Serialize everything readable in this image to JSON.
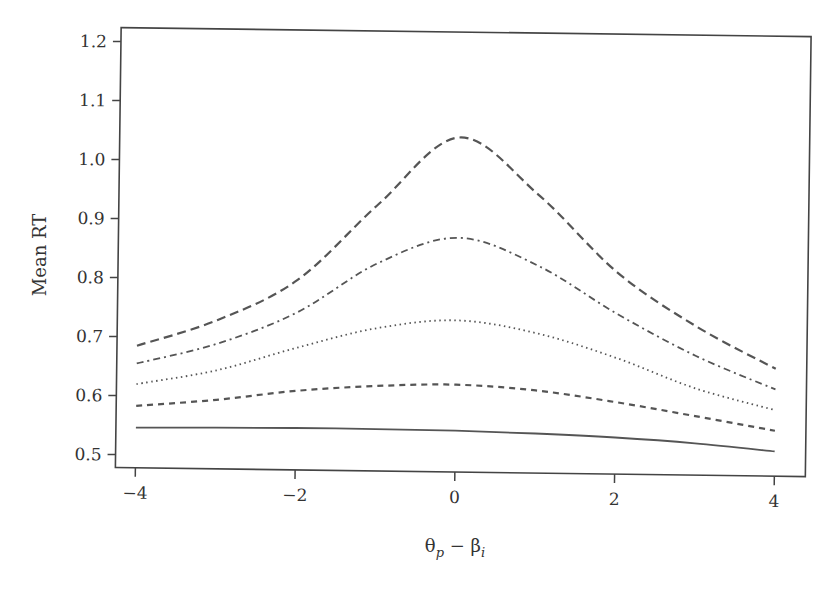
{
  "chart_data": {
    "type": "line",
    "title": "",
    "xlabel": "θp − βi",
    "xlabel_parts": {
      "theta": "θ",
      "theta_sub": "p",
      "minus": " − ",
      "beta": "β",
      "beta_sub": "i"
    },
    "ylabel": "Mean RT",
    "xlim": [
      -4,
      4
    ],
    "ylim": [
      0.5,
      1.2
    ],
    "x_ticks": [
      -4,
      -2,
      0,
      2,
      4
    ],
    "x_tick_labels": [
      "−4",
      "−2",
      "0",
      "2",
      "4"
    ],
    "y_ticks": [
      0.5,
      0.6,
      0.7,
      0.8,
      0.9,
      1.0,
      1.1,
      1.2
    ],
    "y_tick_labels": [
      "0.5",
      "0.6",
      "0.7",
      "0.8",
      "0.9",
      "1.0",
      "1.1",
      "1.2"
    ],
    "grid": false,
    "legend": null,
    "x": [
      -4,
      -3,
      -2,
      -1,
      0,
      1,
      2,
      3,
      4
    ],
    "series": [
      {
        "name": "long-dash",
        "style": "long-dash",
        "values": [
          0.685,
          0.73,
          0.8,
          0.93,
          1.045,
          0.95,
          0.82,
          0.73,
          0.66
        ]
      },
      {
        "name": "dash-dot",
        "style": "dash-dot",
        "values": [
          0.655,
          0.69,
          0.745,
          0.83,
          0.875,
          0.83,
          0.75,
          0.68,
          0.625
        ]
      },
      {
        "name": "dotted",
        "style": "dotted",
        "values": [
          0.62,
          0.645,
          0.685,
          0.72,
          0.735,
          0.715,
          0.675,
          0.625,
          0.59
        ]
      },
      {
        "name": "short-dash",
        "style": "short-dash",
        "values": [
          0.583,
          0.595,
          0.612,
          0.622,
          0.626,
          0.618,
          0.6,
          0.578,
          0.555
        ]
      },
      {
        "name": "solid",
        "style": "solid",
        "values": [
          0.546,
          0.548,
          0.549,
          0.549,
          0.548,
          0.545,
          0.54,
          0.532,
          0.52
        ]
      }
    ]
  }
}
